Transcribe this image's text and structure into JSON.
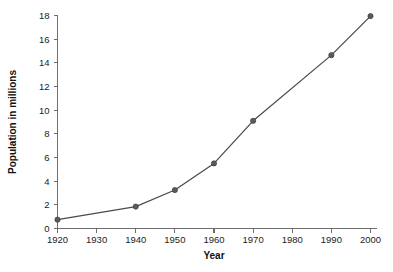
{
  "chart_data": {
    "type": "line",
    "title": "",
    "subtitle": "",
    "xlabel": "Year",
    "ylabel": "Population in millions",
    "x": [
      1920,
      1940,
      1950,
      1960,
      1970,
      1990,
      2000
    ],
    "values": [
      0.75,
      1.85,
      3.25,
      5.5,
      9.1,
      14.65,
      17.95
    ],
    "series": [
      {
        "name": "Population",
        "x": [
          1920,
          1940,
          1950,
          1960,
          1970,
          1990,
          2000
        ],
        "values": [
          0.75,
          1.85,
          3.25,
          5.5,
          9.1,
          14.65,
          17.95
        ]
      }
    ],
    "xlim": [
      1920,
      2000
    ],
    "ylim": [
      0,
      18
    ],
    "xticks": [
      1920,
      1930,
      1940,
      1950,
      1960,
      1970,
      1980,
      1990,
      2000
    ],
    "xtick_labels": [
      "1920",
      "1930",
      "1940",
      "1950",
      "1960",
      "1970",
      "1980",
      "1990",
      "2000"
    ],
    "yticks": [
      0,
      2,
      4,
      6,
      8,
      10,
      12,
      14,
      16,
      18
    ],
    "ytick_labels": [
      "0",
      "2",
      "4",
      "6",
      "8",
      "10",
      "12",
      "14",
      "16",
      "18"
    ],
    "grid": false,
    "legend": null,
    "legend_position": "none",
    "annotations": [],
    "colors": {
      "line": "#4a4a52",
      "marker": "#5a5a62",
      "axis": "#6e6e6e",
      "text": "#1a1a1a",
      "background": "#ffffff"
    }
  }
}
